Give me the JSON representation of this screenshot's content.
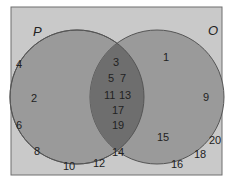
{
  "diagram": {
    "type": "venn",
    "colors": {
      "background": "#c9c9c9",
      "border": "#6e6e6e",
      "circle_fill": "#9a9a9a",
      "circle_stroke": "#555555",
      "intersection_fill": "#6e6e6e"
    },
    "sets": {
      "left": {
        "label": "P"
      },
      "right": {
        "label": "O"
      }
    },
    "regions": {
      "left_only": [
        "2"
      ],
      "intersection": [
        "3",
        "5",
        "7",
        "11",
        "13",
        "17",
        "19"
      ],
      "right_only": [
        "1",
        "9",
        "15"
      ],
      "outside": [
        "4",
        "6",
        "8",
        "10",
        "12",
        "14",
        "16",
        "18",
        "20"
      ]
    },
    "numbers": {
      "n1": "1",
      "n2": "2",
      "n3": "3",
      "n4": "4",
      "n5": "5",
      "n6": "6",
      "n7": "7",
      "n8": "8",
      "n9": "9",
      "n10": "10",
      "n11": "11",
      "n12": "12",
      "n13": "13",
      "n14": "14",
      "n15": "15",
      "n16": "16",
      "n17": "17",
      "n18": "18",
      "n19": "19",
      "n20": "20"
    }
  }
}
